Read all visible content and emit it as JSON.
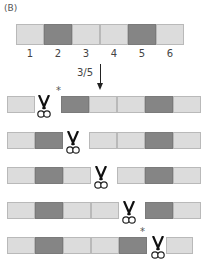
{
  "panel_label": "(B)",
  "colors": {
    "light": "#dcdcdc",
    "dark": "#858585",
    "border": "#b9b9b9"
  },
  "top_bar": {
    "segments": [
      {
        "index": 1,
        "label": "1",
        "shade": "light"
      },
      {
        "index": 2,
        "label": "2",
        "shade": "dark"
      },
      {
        "index": 3,
        "label": "3",
        "shade": "light"
      },
      {
        "index": 4,
        "label": "4",
        "shade": "light"
      },
      {
        "index": 5,
        "label": "5",
        "shade": "dark"
      },
      {
        "index": 6,
        "label": "6",
        "shade": "light"
      }
    ]
  },
  "arrow": {
    "label": "3/5",
    "icon": "down-arrow-icon"
  },
  "cut_rows": [
    {
      "cut_after": 1,
      "star": true,
      "star_position": "after-cut"
    },
    {
      "cut_after": 2,
      "star": false
    },
    {
      "cut_after": 3,
      "star": false
    },
    {
      "cut_after": 4,
      "star": false
    },
    {
      "cut_after": 5,
      "star": true,
      "star_position": "before-cut"
    }
  ],
  "icons": {
    "scissors": "scissors-icon",
    "star": "*"
  }
}
